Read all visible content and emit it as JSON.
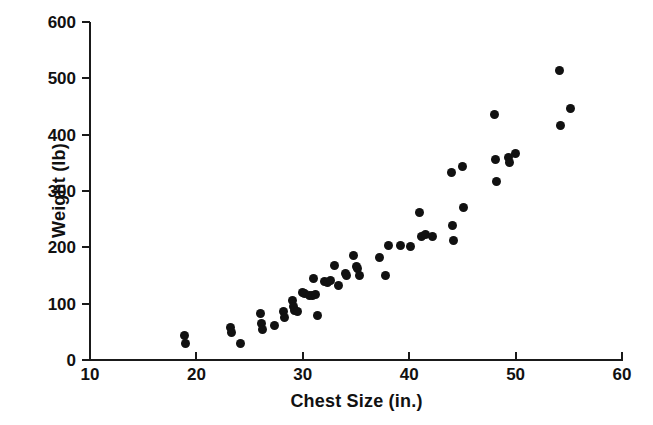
{
  "chart_data": {
    "type": "scatter",
    "title": "",
    "xlabel": "Chest Size (in.)",
    "ylabel": "Weight (lb)",
    "xlim": [
      10,
      60
    ],
    "ylim": [
      0,
      600
    ],
    "xticks": [
      10,
      20,
      30,
      40,
      50,
      60
    ],
    "yticks": [
      0,
      100,
      200,
      300,
      400,
      500,
      600
    ],
    "xtick_labels": [
      "10",
      "20",
      "30",
      "40",
      "50",
      "60"
    ],
    "ytick_labels": [
      "0",
      "100",
      "200",
      "300",
      "400",
      "500",
      "600"
    ],
    "grid": false,
    "legend": false,
    "marker_color": "#111111",
    "marker_shape": "circle",
    "series": [
      {
        "name": "Bears",
        "points": [
          [
            18.9,
            44
          ],
          [
            19.0,
            30
          ],
          [
            23.2,
            57
          ],
          [
            23.3,
            48
          ],
          [
            24.1,
            29
          ],
          [
            26.0,
            82
          ],
          [
            26.1,
            64
          ],
          [
            26.2,
            55
          ],
          [
            27.3,
            62
          ],
          [
            28.2,
            86
          ],
          [
            28.3,
            76
          ],
          [
            29.0,
            105
          ],
          [
            29.1,
            95
          ],
          [
            29.2,
            88
          ],
          [
            29.5,
            86
          ],
          [
            30.0,
            120
          ],
          [
            30.2,
            118
          ],
          [
            30.6,
            115
          ],
          [
            30.9,
            114
          ],
          [
            31.0,
            144
          ],
          [
            31.2,
            116
          ],
          [
            31.4,
            79
          ],
          [
            32.0,
            140
          ],
          [
            32.3,
            138
          ],
          [
            32.6,
            141
          ],
          [
            33.0,
            168
          ],
          [
            33.4,
            132
          ],
          [
            34.0,
            153
          ],
          [
            34.1,
            150
          ],
          [
            34.8,
            185
          ],
          [
            35.0,
            166
          ],
          [
            35.1,
            162
          ],
          [
            35.3,
            150
          ],
          [
            37.2,
            182
          ],
          [
            37.8,
            150
          ],
          [
            38.1,
            204
          ],
          [
            39.2,
            203
          ],
          [
            40.1,
            202
          ],
          [
            41.0,
            262
          ],
          [
            41.2,
            220
          ],
          [
            41.5,
            222
          ],
          [
            42.2,
            220
          ],
          [
            44.0,
            332
          ],
          [
            44.1,
            238
          ],
          [
            44.2,
            212
          ],
          [
            45.0,
            344
          ],
          [
            45.1,
            270
          ],
          [
            48.0,
            435
          ],
          [
            48.1,
            356
          ],
          [
            48.2,
            316
          ],
          [
            49.3,
            360
          ],
          [
            49.4,
            350
          ],
          [
            50.0,
            366
          ],
          [
            54.1,
            514
          ],
          [
            54.2,
            416
          ],
          [
            55.2,
            446
          ]
        ]
      }
    ]
  }
}
